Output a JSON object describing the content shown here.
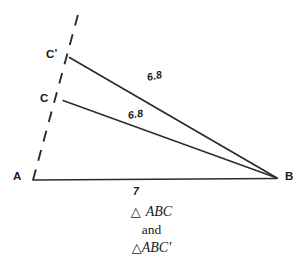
{
  "figure": {
    "kind": "geometry-diagram",
    "stroke_color": "#2b2b2b",
    "text_color": "#1a1a1a",
    "background_color": "#ffffff"
  },
  "vertices": {
    "a": {
      "label": "A",
      "x": 33,
      "y": 180,
      "label_x": 13,
      "label_y": 172
    },
    "b": {
      "label": "B",
      "x": 277,
      "y": 178,
      "label_x": 285,
      "label_y": 172
    },
    "c": {
      "label": "C",
      "x": 63,
      "y": 100,
      "label_x": 40,
      "label_y": 93
    },
    "c_prime": {
      "label": "C",
      "prime": "'",
      "x": 70,
      "y": 57,
      "label_x": 46,
      "label_y": 49
    }
  },
  "segments": {
    "base_ab": {
      "from": "A",
      "to": "B",
      "style": "solid"
    },
    "c_to_b": {
      "from": "C",
      "to": "B",
      "style": "solid"
    },
    "cprime_to_b": {
      "from": "C'",
      "to": "B",
      "style": "solid"
    },
    "ray_dashed": {
      "from": "A",
      "through": "C and C'",
      "style": "dashed"
    }
  },
  "measures": {
    "base_length": {
      "value": "7",
      "x": 133,
      "y": 186
    },
    "upper_side": {
      "value": "6.8",
      "x": 147,
      "y": 76
    },
    "lower_side": {
      "value": "6.8",
      "x": 128,
      "y": 112
    }
  },
  "caption": {
    "line1_triangle": "△",
    "line1_text": "ABC",
    "line2_text": "and",
    "line3_triangle": "△",
    "line3_text": "ABC",
    "line3_prime": "′"
  }
}
